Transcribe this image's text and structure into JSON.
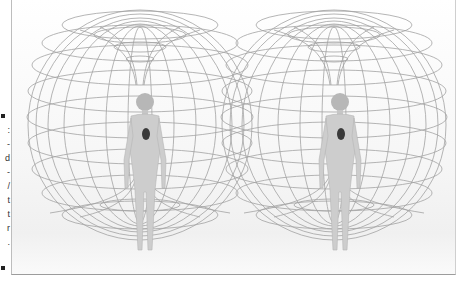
{
  "figure": {
    "left_figure": {
      "label": "person-left"
    },
    "right_figure": {
      "label": "person-right"
    }
  },
  "truncated_caption": {
    "glyphs": [
      ":",
      "-",
      "d",
      "-",
      "/",
      "t",
      "t",
      "r",
      "."
    ]
  },
  "colors": {
    "wire": "#9a9a9a",
    "body": "#c8c8c8",
    "heart": "#3a3a3a",
    "frame_border": "#a0a0a0"
  }
}
